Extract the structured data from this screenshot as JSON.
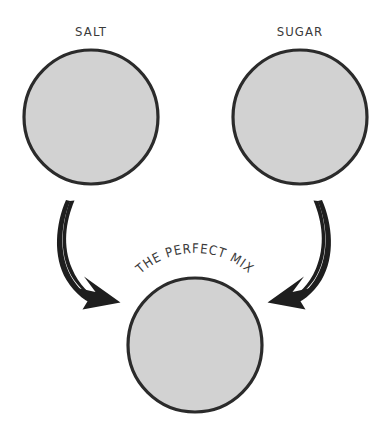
{
  "diagram": {
    "type": "venn-style flow diagram",
    "background_color": "#FFFFFF",
    "circle_fill_color": "#D2D2D2",
    "circle_stroke_color": "#2B2B2B",
    "arrow_color": "#1E1E1E",
    "text_color": "#3A3A3A",
    "nodes": [
      {
        "id": "salt",
        "label": "SALT",
        "cx": 91,
        "cy": 117,
        "r": 67,
        "label_x": 91,
        "label_y": 36
      },
      {
        "id": "sugar",
        "label": "SUGAR",
        "cx": 300,
        "cy": 117,
        "r": 67,
        "label_x": 300,
        "label_y": 36
      },
      {
        "id": "mix",
        "label": "THE PERFECT MIX",
        "cx": 195,
        "cy": 345,
        "r": 67,
        "label_curved": true
      }
    ],
    "arrows": [
      {
        "id": "salt-to-mix",
        "from": "salt",
        "to": "mix",
        "direction": "down-right"
      },
      {
        "id": "sugar-to-mix",
        "from": "sugar",
        "to": "mix",
        "direction": "down-left"
      }
    ]
  }
}
